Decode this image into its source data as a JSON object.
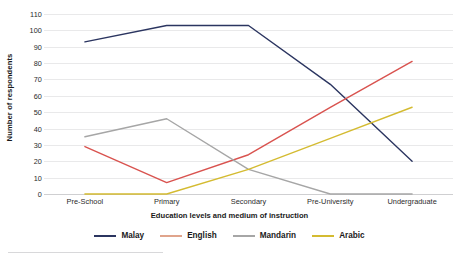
{
  "chart_data": {
    "type": "line",
    "title": "",
    "xlabel": "Education levels and medium of instruction",
    "ylabel": "Number of respondents",
    "categories": [
      "Pre-School",
      "Primary",
      "Secondary",
      "Pre-University",
      "Undergraduate"
    ],
    "ylim": [
      0,
      110
    ],
    "ytick_labels": [
      "0",
      "10",
      "20",
      "30",
      "40",
      "50",
      "60",
      "70",
      "80",
      "90",
      "100",
      "110"
    ],
    "ytick_values": [
      0,
      10,
      20,
      30,
      40,
      50,
      60,
      70,
      80,
      90,
      100,
      110
    ],
    "grid": true,
    "legend_position": "bottom",
    "series": [
      {
        "name": "Malay",
        "color": "#2b3560",
        "values": [
          93,
          103,
          103,
          67,
          20
        ]
      },
      {
        "name": "English",
        "color": "#d9534f",
        "values": [
          29,
          7,
          24,
          53,
          81
        ]
      },
      {
        "name": "Mandarin",
        "color": "#a6a6a6",
        "values": [
          35,
          46,
          15,
          0,
          0
        ]
      },
      {
        "name": "Arabic",
        "color": "#d4bb31",
        "values": [
          0,
          0,
          15,
          34,
          53
        ]
      }
    ],
    "legend": [
      {
        "label": "Malay",
        "color": "#2b3560"
      },
      {
        "label": "English",
        "color": "#e0a48c"
      },
      {
        "label": "Mandarin",
        "color": "#a6a6a6"
      },
      {
        "label": "Arabic",
        "color": "#d4bb31"
      }
    ]
  }
}
